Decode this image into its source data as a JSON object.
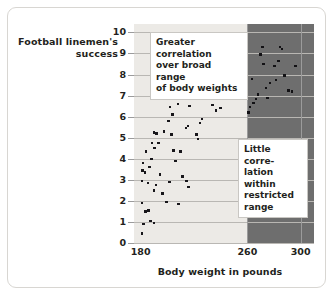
{
  "chart_data": {
    "type": "scatter",
    "title": "",
    "xlabel": "Body weight in pounds",
    "ylabel": "Football linemen's success",
    "ylabel_line1": "Football linemen's",
    "ylabel_line2": "success",
    "xlim": [
      175,
      310
    ],
    "ylim": [
      0,
      10.4
    ],
    "xticks": [
      180,
      260,
      300
    ],
    "yticks": [
      0,
      1,
      2,
      3,
      4,
      5,
      6,
      7,
      8,
      9,
      10
    ],
    "grid": "horizontal",
    "legend": "none",
    "regions": [
      {
        "name": "broad-range",
        "x_start": 175,
        "x_end": 260,
        "color": "#eceae6"
      },
      {
        "name": "restricted-range",
        "x_start": 260,
        "x_end": 310,
        "color": "#6e6e6e"
      }
    ],
    "annotations": [
      {
        "name": "broad-range-note",
        "text": "Greater correlation over broad range of body weights",
        "lines": [
          "Greater correlation",
          "over broad range",
          "of body weights"
        ]
      },
      {
        "name": "restricted-range-note",
        "text": "Little correlation within restricted range",
        "lines": [
          "Little corre-",
          "lation within",
          "restricted",
          "range"
        ]
      }
    ],
    "series": [
      {
        "name": "broad-range-points",
        "region": "light",
        "points": [
          [
            181.0,
            0.45
          ],
          [
            182.0,
            0.9
          ],
          [
            181.2,
            1.9
          ],
          [
            183.5,
            1.5
          ],
          [
            186.0,
            1.55
          ],
          [
            187.5,
            1.05
          ],
          [
            190.0,
            0.95
          ],
          [
            181.0,
            2.95
          ],
          [
            181.4,
            3.45
          ],
          [
            181.6,
            3.8
          ],
          [
            183.2,
            3.35
          ],
          [
            185.5,
            2.85
          ],
          [
            186.5,
            3.6
          ],
          [
            184.0,
            4.35
          ],
          [
            188.0,
            4.0
          ],
          [
            188.4,
            4.75
          ],
          [
            190.5,
            4.5
          ],
          [
            190.0,
            5.25
          ],
          [
            192.0,
            5.2
          ],
          [
            193.5,
            4.75
          ],
          [
            190.2,
            2.5
          ],
          [
            191.5,
            2.75
          ],
          [
            194.5,
            3.25
          ],
          [
            196.5,
            2.35
          ],
          [
            197.5,
            5.3
          ],
          [
            202.0,
            6.45
          ],
          [
            204.0,
            6.1
          ],
          [
            203.0,
            5.15
          ],
          [
            201.0,
            5.8
          ],
          [
            201.5,
            2.9
          ],
          [
            199.5,
            1.95
          ],
          [
            204.5,
            4.4
          ],
          [
            206.0,
            3.9
          ],
          [
            208.0,
            6.6
          ],
          [
            210.5,
            7.1
          ],
          [
            210.0,
            4.35
          ],
          [
            208.5,
            1.85
          ],
          [
            211.5,
            3.15
          ],
          [
            214.5,
            2.95
          ],
          [
            216.0,
            2.65
          ],
          [
            215.5,
            5.55
          ],
          [
            214.0,
            5.45
          ],
          [
            216.5,
            6.5
          ],
          [
            217.5,
            6.95
          ],
          [
            218.0,
            7.3
          ],
          [
            218.5,
            7.45
          ],
          [
            221.0,
            6.9
          ],
          [
            222.0,
            5.15
          ],
          [
            223.0,
            4.95
          ],
          [
            224.5,
            5.7
          ],
          [
            226.0,
            5.9
          ],
          [
            228.0,
            7.65
          ],
          [
            230.0,
            7.85
          ],
          [
            233.0,
            8.15
          ],
          [
            234.0,
            6.55
          ],
          [
            236.5,
            6.3
          ],
          [
            239.5,
            7.55
          ],
          [
            240.0,
            6.4
          ]
        ]
      },
      {
        "name": "restricted-range-points",
        "region": "dark",
        "points": [
          [
            261.0,
            6.2
          ],
          [
            262.0,
            6.45
          ],
          [
            263.5,
            7.8
          ],
          [
            264.5,
            6.65
          ],
          [
            266.5,
            6.85
          ],
          [
            268.0,
            7.05
          ],
          [
            270.0,
            8.95
          ],
          [
            271.5,
            9.3
          ],
          [
            272.0,
            8.5
          ],
          [
            274.0,
            7.35
          ],
          [
            275.0,
            6.9
          ],
          [
            277.0,
            7.6
          ],
          [
            280.5,
            8.4
          ],
          [
            281.5,
            7.75
          ],
          [
            283.5,
            8.65
          ],
          [
            284.5,
            9.3
          ],
          [
            286.0,
            9.2
          ],
          [
            288.0,
            7.95
          ],
          [
            291.0,
            7.25
          ],
          [
            293.5,
            7.2
          ],
          [
            296.0,
            8.4
          ]
        ]
      }
    ]
  },
  "axis": {
    "y_title_line1": "Football linemen's",
    "y_title_line2": "success",
    "x_title": "Body weight in pounds",
    "y_tick_10": "10",
    "y_tick_9": "9",
    "y_tick_8": "8",
    "y_tick_7": "7",
    "y_tick_6": "6",
    "y_tick_5": "5",
    "y_tick_4": "4",
    "y_tick_3": "3",
    "y_tick_2": "2",
    "y_tick_1": "1",
    "y_tick_0": "0",
    "x_tick_180": "180",
    "x_tick_260": "260",
    "x_tick_300": "300"
  },
  "callouts": {
    "broad_line1": "Greater correlation",
    "broad_line2": "over broad range",
    "broad_line3": "of body weights",
    "restricted_line1": "Little corre-",
    "restricted_line2": "lation within",
    "restricted_line3": "restricted",
    "restricted_line4": "range"
  },
  "colors": {
    "light_region": "#eceae6",
    "dark_region": "#6e6e6e",
    "point": "#17161a",
    "gridline": "#b9b7b3",
    "text": "#231f20",
    "frame": "#d8d6d2"
  }
}
